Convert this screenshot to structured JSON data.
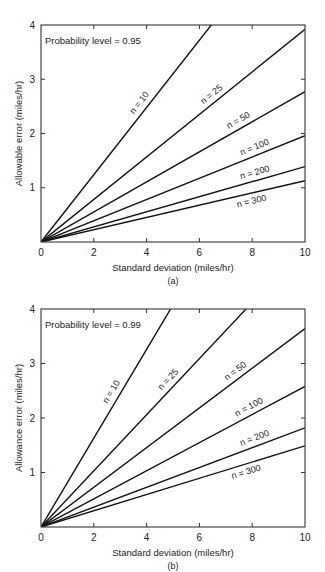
{
  "chart_data": [
    {
      "type": "line",
      "panel": "(a)",
      "caption": "(a)",
      "annotation": "Probability level = 0.95",
      "xlabel": "Standard deviation (miles/hr)",
      "ylabel": "Allowable error (miles/hr)",
      "xlim": [
        0,
        10
      ],
      "ylim": [
        0,
        4
      ],
      "xticks": [
        "0",
        "2",
        "4",
        "6",
        "8",
        "10"
      ],
      "yticks": [
        "1",
        "2",
        "3",
        "4"
      ],
      "grid": false,
      "x": [
        0,
        10
      ],
      "series": [
        {
          "name": "n = 10",
          "label": "n = 10",
          "slope": 0.62,
          "values": [
            0,
            6.2
          ]
        },
        {
          "name": "n = 25",
          "label": "n = 25",
          "slope": 0.392,
          "values": [
            0,
            3.92
          ]
        },
        {
          "name": "n = 50",
          "label": "n = 50",
          "slope": 0.277,
          "values": [
            0,
            2.77
          ]
        },
        {
          "name": "n = 100",
          "label": "n = 100",
          "slope": 0.196,
          "values": [
            0,
            1.96
          ]
        },
        {
          "name": "n = 200",
          "label": "n = 200",
          "slope": 0.139,
          "values": [
            0,
            1.39
          ]
        },
        {
          "name": "n = 300",
          "label": "n = 300",
          "slope": 0.113,
          "values": [
            0,
            1.13
          ]
        }
      ]
    },
    {
      "type": "line",
      "panel": "(b)",
      "caption": "(b)",
      "annotation": "Probability level = 0.99",
      "xlabel": "Standard deviation (miles/hr)",
      "ylabel": "Allowance error (miles/hr)",
      "xlim": [
        0,
        10
      ],
      "ylim": [
        0,
        4
      ],
      "xticks": [
        "0",
        "2",
        "4",
        "6",
        "8",
        "10"
      ],
      "yticks": [
        "1",
        "2",
        "3",
        "4"
      ],
      "grid": false,
      "x": [
        0,
        10
      ],
      "series": [
        {
          "name": "n = 10",
          "label": "n = 10",
          "slope": 0.815,
          "values": [
            0,
            8.15
          ]
        },
        {
          "name": "n = 25",
          "label": "n = 25",
          "slope": 0.515,
          "values": [
            0,
            5.15
          ]
        },
        {
          "name": "n = 50",
          "label": "n = 50",
          "slope": 0.364,
          "values": [
            0,
            3.64
          ]
        },
        {
          "name": "n = 100",
          "label": "n = 100",
          "slope": 0.258,
          "values": [
            0,
            2.58
          ]
        },
        {
          "name": "n = 200",
          "label": "n = 200",
          "slope": 0.182,
          "values": [
            0,
            1.82
          ]
        },
        {
          "name": "n = 300",
          "label": "n = 300",
          "slope": 0.149,
          "values": [
            0,
            1.49
          ]
        }
      ]
    }
  ],
  "panels": [
    {
      "frame": {
        "x0": 41,
        "y0": 25,
        "x1": 305,
        "y1": 242
      },
      "label_pos": [
        {
          "t": 0.62,
          "dx": -5,
          "dy": -3
        },
        {
          "t": 0.66,
          "dx": -2,
          "dy": -5
        },
        {
          "t": 0.76,
          "dx": -2,
          "dy": -5
        },
        {
          "t": 0.82,
          "dx": -2,
          "dy": -5
        },
        {
          "t": 0.82,
          "dx": -2,
          "dy": -5
        },
        {
          "t": 0.8,
          "dx": 0,
          "dy": 11
        }
      ]
    },
    {
      "frame": {
        "x0": 41,
        "y0": 309,
        "x1": 305,
        "y1": 527
      },
      "label_pos": [
        {
          "t": 0.6,
          "dx": -5,
          "dy": -3
        },
        {
          "t": 0.65,
          "dx": -4,
          "dy": -4
        },
        {
          "t": 0.75,
          "dx": -2,
          "dy": -5
        },
        {
          "t": 0.8,
          "dx": -2,
          "dy": -5
        },
        {
          "t": 0.82,
          "dx": -2,
          "dy": -5
        },
        {
          "t": 0.78,
          "dx": 0,
          "dy": 11
        }
      ]
    }
  ],
  "colors": {
    "line": "#111111",
    "frame": "#333333",
    "text": "#222222",
    "background": "#ffffff"
  }
}
